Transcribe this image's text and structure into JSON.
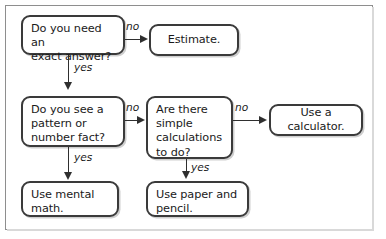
{
  "figure": {
    "type": "flowchart",
    "title": "",
    "background_color": "#ffffff",
    "border_color": "#8e8e8e",
    "node_border_color": "#3a3a3a",
    "text_color": "#1a1a1a"
  },
  "nodes": {
    "q_exact_answer": "Do you need an\nexact answer?",
    "estimate": "Estimate.",
    "q_pattern_fact": "Do you see a\npattern or\nnumber fact?",
    "q_simple_calc": "Are there\nsimple\ncalculations\nto do?",
    "use_calculator": "Use a calculator.",
    "use_mental_math": "Use mental\nmath.",
    "use_paper_pencil": "Use paper and\npencil."
  },
  "edges": {
    "exact_answer_no": "no",
    "exact_answer_yes": "yes",
    "pattern_fact_no": "no",
    "pattern_fact_yes": "yes",
    "simple_calc_no": "no",
    "simple_calc_yes": "yes"
  }
}
